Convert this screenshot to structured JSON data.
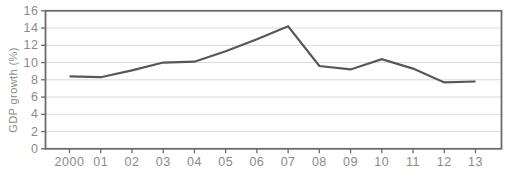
{
  "chart_data": {
    "type": "line",
    "title": "",
    "xlabel": "",
    "ylabel": "GDP growth (%)",
    "categories": [
      "2000",
      "01",
      "02",
      "03",
      "04",
      "05",
      "06",
      "07",
      "08",
      "09",
      "10",
      "11",
      "12",
      "13"
    ],
    "series": [
      {
        "name": "GDP growth",
        "values": [
          8.4,
          8.3,
          9.1,
          10.0,
          10.1,
          11.3,
          12.7,
          14.2,
          9.6,
          9.2,
          10.4,
          9.3,
          7.7,
          7.8
        ]
      }
    ],
    "ylim": [
      0,
      16
    ],
    "yticks": [
      0,
      2,
      4,
      6,
      8,
      10,
      12,
      14,
      16
    ],
    "grid": true,
    "legend_position": "none",
    "colors": {
      "line": "#575757",
      "grid": "#d9d9d9",
      "frame": "#6b6b6b",
      "tick": "#6b6b6b",
      "text": "#8a8a8a",
      "background": "#ffffff"
    }
  }
}
